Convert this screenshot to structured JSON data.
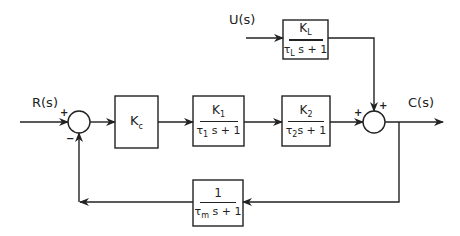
{
  "signals": {
    "input": "R(s)",
    "disturbance": "U(s)",
    "output": "C(s)"
  },
  "summing_junctions": [
    {
      "id": "sum1",
      "signs": {
        "left": "+",
        "bottom": "−"
      }
    },
    {
      "id": "sum2",
      "signs": {
        "left": "+",
        "top": "+"
      }
    }
  ],
  "blocks": {
    "controller": {
      "label": "K",
      "sub": "c"
    },
    "process1": {
      "num": "K",
      "num_sub": "1",
      "den_pre": "τ",
      "den_sub": "1",
      "den_post": " s + 1"
    },
    "process2": {
      "num": "K",
      "num_sub": "2",
      "den_pre": "τ",
      "den_sub": "2",
      "den_post": "s + 1"
    },
    "load": {
      "num": "K",
      "num_sub": "L",
      "den_pre": "τ",
      "den_sub": "L",
      "den_post": " s + 1"
    },
    "measurement": {
      "num": "1",
      "den_pre": "τ",
      "den_sub": "m",
      "den_post": " s + 1"
    }
  },
  "colors": {
    "stroke": "#222222",
    "background": "#ffffff"
  }
}
